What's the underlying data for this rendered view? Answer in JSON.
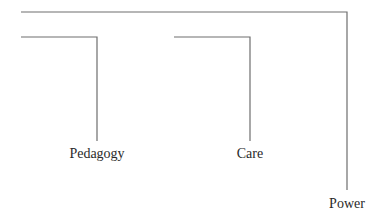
{
  "diagram": {
    "type": "bracket-hierarchy",
    "line_color": "#6e6e6e",
    "text_color": "#2a2a2a",
    "nodes": [
      {
        "id": "pedagogy",
        "label": "Pedagogy"
      },
      {
        "id": "care",
        "label": "Care"
      },
      {
        "id": "power",
        "label": "Power"
      }
    ]
  }
}
